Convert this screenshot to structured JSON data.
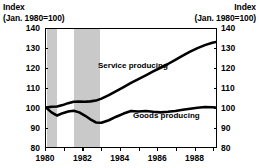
{
  "header": {
    "left_title_line1": "Index",
    "left_title_line2": "(Jan. 1980=100)",
    "right_title_line1": "Index",
    "right_title_line2": "(Jan. 1980=100)"
  },
  "chart_data": {
    "type": "line",
    "title": "Index (Jan. 1980=100)",
    "xlabel": "",
    "ylabel": "Index (Jan. 1980=100)",
    "ylim": [
      80,
      140
    ],
    "xlim": [
      1980,
      1989.2
    ],
    "yticks": [
      140,
      130,
      120,
      110,
      100,
      90,
      80
    ],
    "ytick_labels": [
      "140",
      "130",
      "120",
      "110",
      "100",
      "90",
      "80"
    ],
    "xticks": [
      1980,
      1981,
      1982,
      1983,
      1984,
      1985,
      1986,
      1987,
      1988,
      1989
    ],
    "xtick_labels": [
      "1980",
      "",
      "1982",
      "",
      "1984",
      "",
      "1986",
      "",
      "1988",
      ""
    ],
    "xtick_labeled": [
      1980,
      1982,
      1984,
      1986,
      1988
    ],
    "grid": false,
    "legend_position": "inline-annotation",
    "annotations": [
      {
        "text": "Service producing",
        "x": 1984.0,
        "y": 118.5
      },
      {
        "text": "Goods producing",
        "x": 1985.8,
        "y": 102.5
      }
    ],
    "shaded_bands": [
      {
        "label": "recession",
        "x_start": 1980.05,
        "x_end": 1980.6,
        "color": "#c9c9c9"
      },
      {
        "label": "recession",
        "x_start": 1981.5,
        "x_end": 1982.9,
        "color": "#c9c9c9"
      }
    ],
    "series": [
      {
        "name": "Service producing",
        "color": "#000000",
        "x": [
          1980.0,
          1980.3,
          1980.6,
          1980.9,
          1981.2,
          1981.5,
          1981.8,
          1982.1,
          1982.4,
          1982.7,
          1983.0,
          1983.4,
          1983.8,
          1984.2,
          1984.6,
          1985.0,
          1985.4,
          1985.8,
          1986.2,
          1986.6,
          1987.0,
          1987.4,
          1987.8,
          1988.2,
          1988.6,
          1989.0,
          1989.2
        ],
        "values": [
          100.0,
          100.5,
          100.6,
          101.3,
          102.3,
          103.0,
          103.1,
          103.0,
          103.2,
          103.6,
          104.6,
          106.4,
          108.4,
          110.5,
          112.6,
          114.5,
          116.4,
          118.4,
          120.3,
          122.2,
          124.3,
          126.5,
          128.5,
          130.3,
          131.8,
          133.0,
          133.4
        ]
      },
      {
        "name": "Goods producing",
        "color": "#000000",
        "x": [
          1980.0,
          1980.3,
          1980.6,
          1980.9,
          1981.2,
          1981.5,
          1981.8,
          1982.1,
          1982.4,
          1982.7,
          1983.0,
          1983.4,
          1983.8,
          1984.2,
          1984.6,
          1985.0,
          1985.4,
          1985.8,
          1986.2,
          1986.6,
          1987.0,
          1987.4,
          1987.8,
          1988.2,
          1988.6,
          1989.0,
          1989.2
        ],
        "values": [
          100.0,
          97.6,
          96.0,
          97.2,
          98.0,
          98.4,
          97.6,
          96.0,
          94.1,
          92.5,
          92.3,
          93.6,
          95.4,
          97.0,
          98.3,
          98.1,
          98.3,
          97.9,
          97.6,
          97.9,
          98.3,
          98.9,
          99.5,
          100.0,
          100.3,
          100.2,
          100.1
        ]
      }
    ]
  }
}
